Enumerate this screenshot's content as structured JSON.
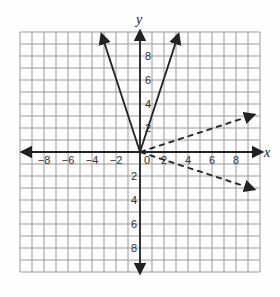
{
  "figure": {
    "axes": {
      "x_label": "x",
      "y_label": "y",
      "x_ticks": [
        "-8",
        "-6",
        "-4",
        "-2",
        "0",
        "2",
        "4",
        "6",
        "8"
      ],
      "y_ticks_pos": [
        "2",
        "4",
        "6",
        "8"
      ],
      "y_ticks_neg": [
        "2",
        "4",
        "6",
        "8"
      ],
      "origin_label": "0",
      "range": [
        -10,
        10
      ]
    },
    "colors": {
      "grid": "#9a9a9a",
      "axis": "#222222",
      "line": "#222222",
      "background": "#fdfdfd"
    },
    "lines": [
      {
        "name": "y = 3x",
        "style": "solid",
        "from": [
          0,
          0
        ],
        "to": [
          3.2,
          9.8
        ]
      },
      {
        "name": "y = -3x",
        "style": "solid",
        "from": [
          0,
          0
        ],
        "to": [
          -3.2,
          9.8
        ]
      },
      {
        "name": "y = x/3",
        "style": "dashed",
        "from": [
          0,
          0
        ],
        "to": [
          9.5,
          3.1
        ]
      },
      {
        "name": "y = -x/3",
        "style": "dashed",
        "from": [
          0,
          0
        ],
        "to": [
          9.5,
          -3.1
        ]
      }
    ]
  }
}
